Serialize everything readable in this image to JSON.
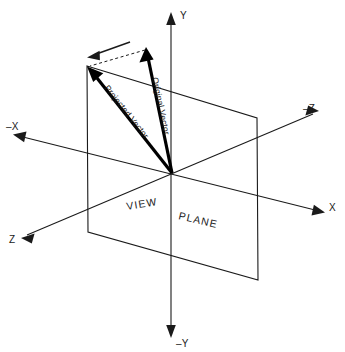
{
  "diagram": {
    "title": "Vector projection onto the view plane",
    "background_color": "#ffffff",
    "stroke_color": "#1a1a1a",
    "vector_color": "#000000",
    "canvas": {
      "width": 345,
      "height": 352
    },
    "origin": {
      "x": 172,
      "y": 173
    },
    "plane": {
      "label_part_1": "VIEW",
      "label_part_2": "PLANE",
      "corners": [
        {
          "name": "top-left",
          "x": 87,
          "y": 66
        },
        {
          "name": "top-right",
          "x": 257,
          "y": 118
        },
        {
          "name": "bottom-right",
          "x": 258,
          "y": 280
        },
        {
          "name": "bottom-left",
          "x": 88,
          "y": 232
        }
      ]
    },
    "axes": [
      {
        "id": "y-positive",
        "label": "Y",
        "tip": {
          "x": 171,
          "y": 14
        },
        "label_pos": {
          "x": 180,
          "y": 16
        }
      },
      {
        "id": "y-negative",
        "label": "–Y",
        "tip": {
          "x": 171,
          "y": 336
        },
        "label_pos": {
          "x": 178,
          "y": 343
        }
      },
      {
        "id": "x-positive",
        "label": "X",
        "tip": {
          "x": 324,
          "y": 212
        },
        "label_pos": {
          "x": 330,
          "y": 208
        }
      },
      {
        "id": "x-negative",
        "label": "–X",
        "tip": {
          "x": 14,
          "y": 137
        },
        "label_pos": {
          "x": 10,
          "y": 127
        }
      },
      {
        "id": "z-positive",
        "label": "Z",
        "tip": {
          "x": 22,
          "y": 239
        },
        "label_pos": {
          "x": 10,
          "y": 240
        }
      },
      {
        "id": "z-negative",
        "label": "–Z",
        "tip": {
          "x": 318,
          "y": 110
        },
        "label_pos": {
          "x": 305,
          "y": 109
        }
      }
    ],
    "vectors": [
      {
        "id": "original-vector",
        "label": "Original Vector",
        "tail": {
          "x": 172,
          "y": 173
        },
        "tip": {
          "x": 146,
          "y": 48
        },
        "label_rotation_deg": -78,
        "label_pos": {
          "x": 152,
          "y": 78
        }
      },
      {
        "id": "projected-vector",
        "label": "Projected Vector",
        "tail": {
          "x": 172,
          "y": 173
        },
        "tip": {
          "x": 88,
          "y": 67
        },
        "label_rotation_deg": 52,
        "label_pos": {
          "x": 107,
          "y": 90
        }
      }
    ],
    "construction": {
      "dashed_line": {
        "id": "projection-trace",
        "from": {
          "x": 145,
          "y": 50
        },
        "to": {
          "x": 89,
          "y": 66
        }
      },
      "projection_direction_arrow": {
        "id": "projection-direction",
        "from": {
          "x": 130,
          "y": 42
        },
        "to": {
          "x": 88,
          "y": 57
        }
      }
    }
  }
}
